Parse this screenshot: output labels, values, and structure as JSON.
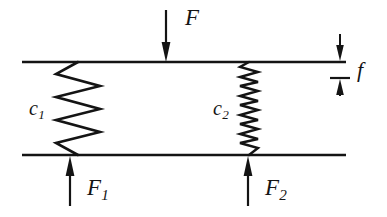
{
  "figure": {
    "type": "mechanical-spring-diagram",
    "background_color": "#ffffff",
    "line_color": "#141414"
  },
  "labels": {
    "applied_force": "F",
    "deflection": "f",
    "spring_constant_left_symbol": "c",
    "spring_constant_left_subscript": "1",
    "spring_constant_right_symbol": "c",
    "spring_constant_right_subscript": "2",
    "reaction_force_left_symbol": "F",
    "reaction_force_left_subscript": "1",
    "reaction_force_right_symbol": "F",
    "reaction_force_right_subscript": "2"
  },
  "geometry": {
    "top_plate": {
      "x1": 22,
      "x2": 346,
      "y": 62
    },
    "bottom_plate": {
      "x1": 22,
      "x2": 346,
      "y": 155
    },
    "spring_left": {
      "name": "c1",
      "x_center": 78,
      "amplitude": 22,
      "coils": 4,
      "y_top": 62,
      "y_bottom": 155,
      "stroke_width": 2.6
    },
    "spring_right": {
      "name": "c2",
      "x_center": 249,
      "amplitude": 9,
      "coils": 10,
      "y_top": 62,
      "y_bottom": 155,
      "stroke_width": 2.4
    },
    "arrow_F": {
      "x": 166,
      "y_from": 10,
      "y_to": 62,
      "direction": "down"
    },
    "arrow_F1": {
      "x": 70,
      "y_from": 206,
      "y_to": 156,
      "direction": "up"
    },
    "arrow_F2": {
      "x": 248,
      "y_from": 206,
      "y_to": 156,
      "direction": "up"
    },
    "deflection_marker": {
      "x": 340,
      "arrow_top_from": 34,
      "arrow_top_to": 61,
      "arrow_bottom_from": 96,
      "arrow_bottom_to": 79,
      "tick_y": 78,
      "tick_half_width": 10
    }
  }
}
